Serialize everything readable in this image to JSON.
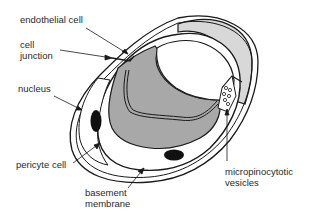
{
  "diagram": {
    "type": "anatomical cross-section",
    "labels": {
      "endothelial_cell": "endothelial cell",
      "cell_junction_1": "cell",
      "cell_junction_2": "junction",
      "nucleus": "nucleus",
      "pericyte_cell": "pericyte cell",
      "basement_membrane_1": "basement",
      "basement_membrane_2": "membrane",
      "micropinocytotic_vesicles_1": "micropinocytotic",
      "micropinocytotic_vesicles_2": "vesicles"
    },
    "colors": {
      "outline": "#1a1a1a",
      "cytoplasm_dark": "#a8a8a8",
      "cytoplasm_light": "#d8d8d8",
      "lumen": "#ffffff",
      "nucleus": "#111111"
    }
  }
}
